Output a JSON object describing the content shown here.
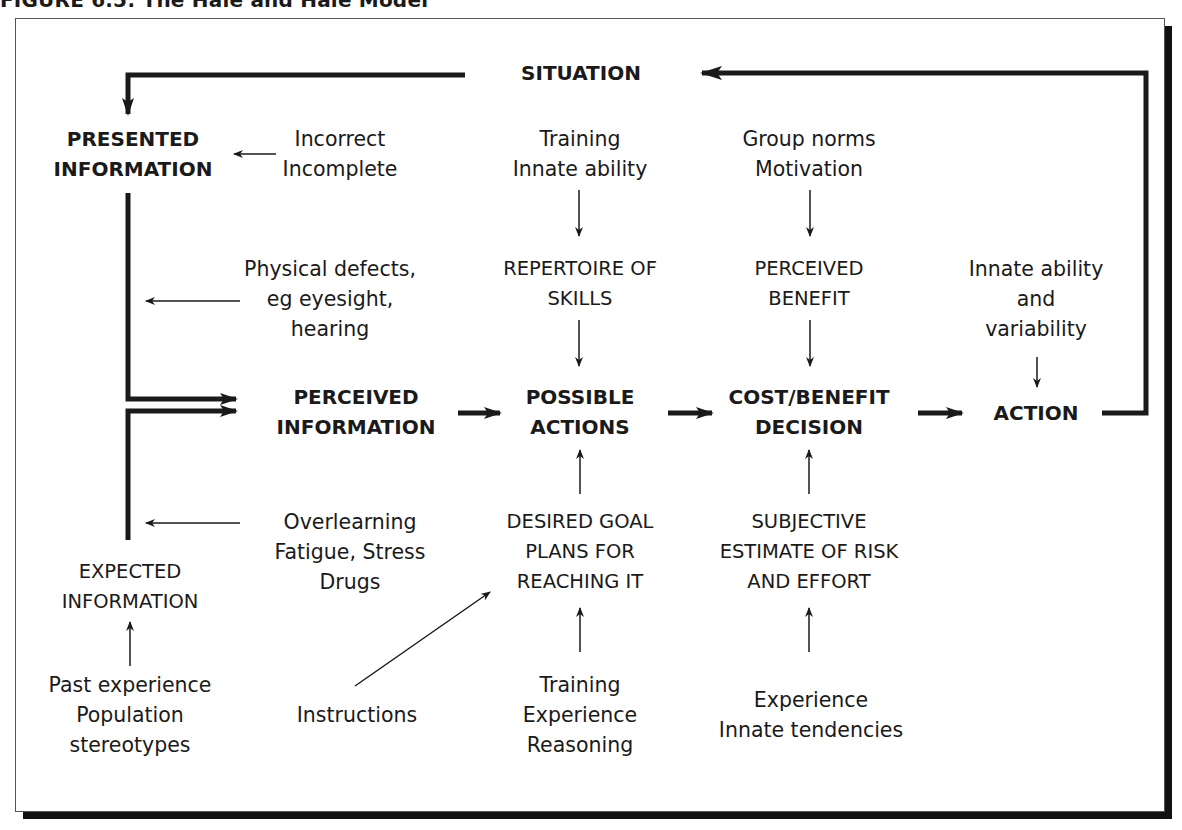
{
  "figure": {
    "title": "FIGURE 6.5: The Hale and Hale Model"
  },
  "nodes": {
    "situation": "SITUATION",
    "presented_information": "PRESENTED\nINFORMATION",
    "perceived_information": "PERCEIVED\nINFORMATION",
    "expected_information": "EXPECTED\nINFORMATION",
    "possible_actions": "POSSIBLE\nACTIONS",
    "cost_benefit_decision": "COST/BENEFIT\nDECISION",
    "action": "ACTION",
    "repertoire_of_skills": "REPERTOIRE OF\nSKILLS",
    "perceived_benefit": "PERCEIVED\nBENEFIT",
    "desired_goal": "DESIRED GOAL\nPLANS FOR\nREACHING IT",
    "subjective_estimate": "SUBJECTIVE\nESTIMATE OF RISK\nAND EFFORT"
  },
  "influences": {
    "incorrect_incomplete": "Incorrect\nIncomplete",
    "training_innate": "Training\nInnate ability",
    "group_norms_motivation": "Group norms\nMotivation",
    "physical_defects": "Physical defects,\neg eyesight,\nhearing",
    "innate_ability_variability": "Innate ability\nand\nvariability",
    "overlearning": "Overlearning\nFatigue, Stress\nDrugs",
    "past_experience": "Past experience\nPopulation\nstereotypes",
    "instructions": "Instructions",
    "training_experience_reasoning": "Training\nExperience\nReasoning",
    "experience_innate_tendencies": "Experience\nInnate tendencies"
  },
  "colors": {
    "ink": "#1a1a1a",
    "background": "#ffffff",
    "shadow": "#111111"
  }
}
